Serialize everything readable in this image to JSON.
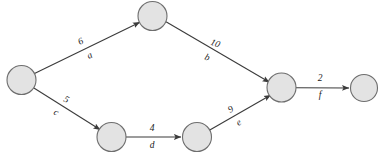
{
  "diagram": {
    "background_color": "#ffffff",
    "node_fill_color": "#e3e3e3",
    "node_stroke_color": "#6e6e6e",
    "edge_color": "#3b3b3b",
    "label_color": "#1a1a1a",
    "nodes": [
      {
        "id": "n1",
        "label": "",
        "cx": 21.5,
        "cy": 80,
        "r": 14.5
      },
      {
        "id": "n2",
        "label": "",
        "cx": 152.5,
        "cy": 16,
        "r": 14.5
      },
      {
        "id": "n3",
        "label": "",
        "cx": 111.5,
        "cy": 137,
        "r": 14.5
      },
      {
        "id": "n4",
        "label": "",
        "cx": 197,
        "cy": 137,
        "r": 14.5
      },
      {
        "id": "n5",
        "label": "",
        "cx": 281.5,
        "cy": 87.5,
        "r": 14.5
      },
      {
        "id": "n6",
        "label": "",
        "cx": 364,
        "cy": 88,
        "r": 13.5
      }
    ],
    "edges": [
      {
        "id": "edge-a",
        "name": "a",
        "weight": "6",
        "from": "n1",
        "to": "n2",
        "weight_x": 81,
        "weight_y": 42,
        "name_x": 90,
        "name_y": 56,
        "rotation": -26
      },
      {
        "id": "edge-b",
        "name": "b",
        "weight": "10",
        "from": "n2",
        "to": "n5",
        "weight_x": 215,
        "weight_y": 44,
        "name_x": 207,
        "name_y": 58,
        "rotation": 21
      },
      {
        "id": "edge-c",
        "name": "c",
        "weight": "5",
        "from": "n1",
        "to": "n3",
        "weight_x": 66,
        "weight_y": 100,
        "name_x": 56,
        "name_y": 113,
        "rotation": 26
      },
      {
        "id": "edge-d",
        "name": "d",
        "weight": "4",
        "from": "n3",
        "to": "n4",
        "weight_x": 152,
        "weight_y": 129,
        "name_x": 152,
        "name_y": 146,
        "rotation": 0
      },
      {
        "id": "edge-e",
        "name": "e",
        "weight": "9",
        "from": "n4",
        "to": "n5",
        "weight_x": 231,
        "weight_y": 110,
        "name_x": 239,
        "name_y": 123,
        "rotation": -29
      },
      {
        "id": "edge-f",
        "name": "f",
        "weight": "2",
        "from": "n5",
        "to": "n6",
        "weight_x": 320,
        "weight_y": 79,
        "name_x": 320,
        "name_y": 96,
        "rotation": 0
      }
    ]
  }
}
